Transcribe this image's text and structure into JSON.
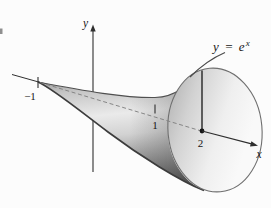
{
  "figure": {
    "labels": {
      "y_axis": "y",
      "x_axis": "x",
      "curve_main": "y = e",
      "curve_sup": "x",
      "left_tick": "−1",
      "unit_tick": "1",
      "point_x": "2"
    },
    "colors": {
      "background": "#fcfcfc",
      "axis_ink": "#2f2f2f",
      "label_ink": "#161616",
      "dashed_axis": "#7d7d7d",
      "curve_ink": "#4a4a4a",
      "body_edge_top": "#4f4f4f",
      "body_edge_bottom": "#3c3c3c",
      "body_g1": "#8c8c8c",
      "body_g2": "#c6c6c6",
      "body_g3": "#eaeaea",
      "body_g4": "#d2d2d2",
      "body_g5": "#949494",
      "body_g6": "#585858",
      "shadow": "#4a4a4a",
      "face_g1": "#a9a9a9",
      "face_g2": "#d2d2d2",
      "face_g3": "#efefef",
      "face_g4": "#f9f9f9",
      "face_rim": "#6f6f6f",
      "artifact": "#8f8f8f"
    }
  }
}
